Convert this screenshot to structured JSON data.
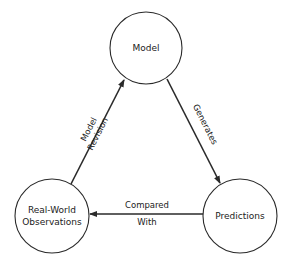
{
  "nodes": {
    "model": {
      "label": "Model"
    },
    "observations": {
      "line1": "Real-World",
      "line2": "Observations"
    },
    "predictions": {
      "label": "Predictions"
    }
  },
  "edges": {
    "revision": {
      "from": "Real-World Observations",
      "to": "Model",
      "line1": "Model",
      "line2": "Revision"
    },
    "generates": {
      "from": "Model",
      "to": "Predictions",
      "label": "Generates"
    },
    "compared": {
      "from": "Predictions",
      "to": "Real-World Observations",
      "line1": "Compared",
      "line2": "With"
    }
  },
  "colors": {
    "stroke": "#2a2a2a",
    "text": "#222222",
    "background": "#ffffff"
  }
}
